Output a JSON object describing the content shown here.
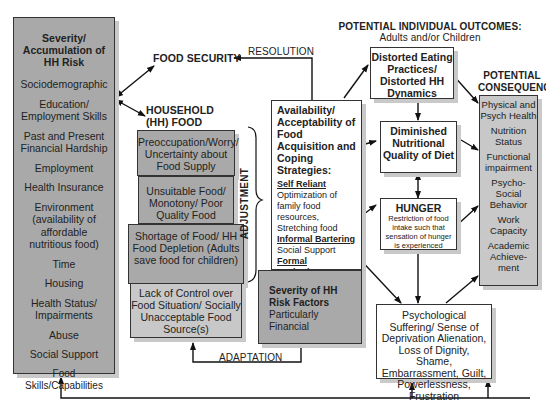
{
  "risk_box": {
    "title": "Severity/ Accumulation of HH Risk",
    "items": [
      "Sociodemographic",
      "Education/ Employment Skills",
      "Past and Present Financial Hardship",
      "Employment",
      "Health Insurance",
      "Environment (availability of affordable nutritious food)",
      "Time",
      "Housing",
      "Health Status/ Impairments",
      "Abuse",
      "Social Support",
      "Food Skills/Capabilities"
    ]
  },
  "food_security": "FOOD SECURITY",
  "resolution": "RESOLUTION",
  "hh_insecurity": "HOUSEHOLD (HH) FOOD INSECURITY",
  "insecurity_levels": [
    "Preoccupation/Worry/ Uncertainty about Food Supply",
    "Unsuitable Food/ Monotony/ Poor Quality Food",
    "Shortage of Food/ HH Food Depletion (Adults save food for children)",
    "Lack of Control over Food Situation/ Socially Unacceptable Food Source(s)"
  ],
  "adjustment": "ADJUSTMENT",
  "adaptation": "ADAPTATION",
  "coping": {
    "title": "Availability/ Acceptability of Food Acquisition and Coping Strategies:",
    "sections": [
      {
        "heading": "Self Reliant",
        "text": "Optimization of family food resources, Stretching food"
      },
      {
        "heading": "Informal Bartering",
        "text": "Social Support"
      },
      {
        "heading": "Formal Institutions",
        "text": "Gov Food Programs (WIC, FSP*, School Lunch) Charity Food Programs, Employment"
      }
    ]
  },
  "severity_factors": {
    "title": "Severity of HH Risk Factors",
    "subtitle": "Particularly Financial"
  },
  "outcomes_header": {
    "title": "POTENTIAL INDIVIDUAL OUTCOMES:",
    "subtitle": "Adults and/or Children"
  },
  "outcomes": {
    "distorted": "Distorted Eating Practices/ Distorted HH Dynamics",
    "diminished": "Diminished Nutritional Quality of Diet",
    "hunger_title": "HUNGER",
    "hunger_text": "Restriction of food intake such that sensation of hunger is experienced",
    "psych": "Psychological Suffering/ Sense of Deprivation Alienation, Loss of Dignity, Shame, Embarrassment, Guilt, Powerlessness, Frustration"
  },
  "consequences": {
    "title": "POTENTIAL CONSEQUENCES",
    "items": [
      "Physical and Psych Health",
      "Nutrition Status",
      "Functional impairment",
      "Psycho-Social Behavior",
      "Work Capacity",
      "Academic Achieve-ment"
    ]
  }
}
